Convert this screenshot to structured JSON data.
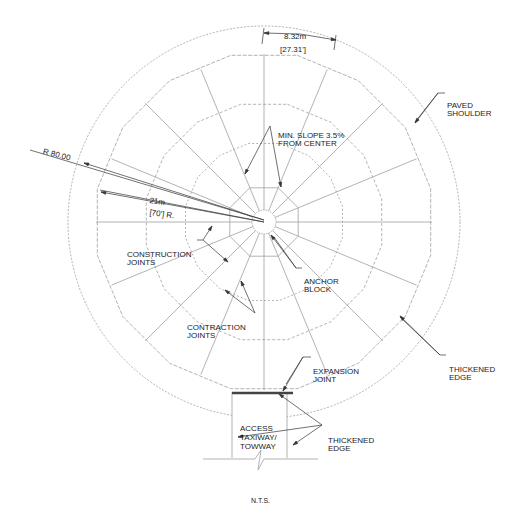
{
  "drawing": {
    "scale_note": "N.T.S.",
    "center": [
      264,
      222
    ],
    "dimensions": {
      "segment_width_metric": "8.32m",
      "segment_width_imperial": "[27.31']",
      "radius_outer": "R 80.00",
      "radius_metric": "21m",
      "radius_imperial": "[70'] R."
    },
    "callouts": {
      "paved_shoulder": [
        "PAVED",
        "SHOULDER"
      ],
      "min_slope": [
        "MIN. SLOPE 3.5%",
        "FROM CENTER"
      ],
      "construction_joints": [
        "CONSTRUCTION",
        "JOINTS"
      ],
      "anchor_block": [
        "ANCHOR",
        "BLOCK"
      ],
      "contraction_joints": [
        "CONTRACTION",
        "JOINTS"
      ],
      "expansion_joint": [
        "EXPANSION",
        "JOINT"
      ],
      "thickened_edge_right": [
        "THICKENED",
        "EDGE"
      ],
      "thickened_edge_bottom": [
        "THICKENED",
        "EDGE"
      ],
      "access_taxiway": [
        "ACCESS",
        "TAXIWAY/",
        "TOWWAY"
      ]
    },
    "colors": {
      "line": "#9a9a9a",
      "leader": "#333333",
      "expansion_joint": "#444444",
      "text": "#222222"
    }
  }
}
